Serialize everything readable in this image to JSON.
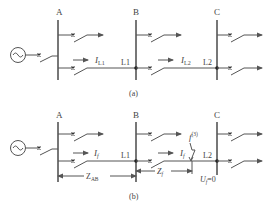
{
  "diagram": {
    "top": {
      "caption": "(a)",
      "buses": [
        "A",
        "B",
        "C"
      ],
      "line_labels": [
        "L1",
        "L2"
      ],
      "currents": [
        {
          "symbol": "I",
          "sub": "L1"
        },
        {
          "symbol": "I",
          "sub": "L2"
        }
      ]
    },
    "bottom": {
      "caption": "(b)",
      "buses": [
        "A",
        "B",
        "C"
      ],
      "line_labels": [
        "L1",
        "L2"
      ],
      "currents": [
        {
          "symbol": "I",
          "sub": "f"
        },
        {
          "symbol": "I",
          "sub": "f"
        }
      ],
      "fault": {
        "symbol": "f",
        "sup": "(3)"
      },
      "impedances": [
        {
          "symbol": "Z",
          "sub": "AB"
        },
        {
          "symbol": "Z",
          "sub": "f"
        }
      ],
      "voltage": {
        "symbol": "U",
        "sub": "f",
        "value": "=0"
      }
    },
    "icons": {
      "generator": "generator-ac-source-icon",
      "breaker": "circuit-breaker-icon"
    },
    "colors": {
      "line": "#555555",
      "text": "#444444",
      "background": "#ffffff"
    }
  }
}
